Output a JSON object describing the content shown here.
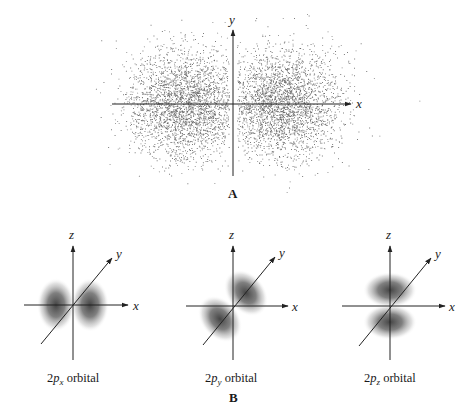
{
  "figure": {
    "panel_a": {
      "label": "A",
      "axes": {
        "x_label": "x",
        "y_label": "y",
        "origin": [
          233,
          104
        ],
        "x_range": [
          112,
          351
        ],
        "y_range": [
          30,
          176
        ]
      },
      "dot_cloud": {
        "description": "electron probability density dot plot of 2p orbital",
        "dot_color": "#555555",
        "seed": 7,
        "lobes": [
          {
            "cx": 186,
            "cy": 104,
            "sx": 30,
            "sy": 26,
            "count": 2600
          },
          {
            "cx": 281,
            "cy": 104,
            "sx": 30,
            "sy": 26,
            "count": 2600
          }
        ],
        "gap_half_width": 4,
        "sparse_halo": {
          "count": 700,
          "rx": 58,
          "ry": 66
        }
      }
    },
    "panel_b": {
      "label": "B",
      "orbitals": [
        {
          "name": "2px",
          "prefix": "2",
          "p": "p",
          "subscript": "x",
          "suffix": " orbital",
          "origin": [
            73,
            305
          ],
          "axes": {
            "z_top": 246,
            "z_bottom": 360,
            "x_left": 24,
            "x_right": 128,
            "y_from": [
              41,
              344
            ],
            "y_to": [
              112,
              258
            ]
          },
          "lobe_orientation": "x"
        },
        {
          "name": "2py",
          "prefix": "2",
          "p": "p",
          "subscript": "y",
          "suffix": " orbital",
          "origin": [
            233,
            306
          ],
          "axes": {
            "z_top": 246,
            "z_bottom": 360,
            "x_left": 186,
            "x_right": 288,
            "y_from": [
              203,
              345
            ],
            "y_to": [
              275,
              257
            ]
          },
          "lobe_orientation": "y"
        },
        {
          "name": "2pz",
          "prefix": "2",
          "p": "p",
          "subscript": "z",
          "suffix": " orbital",
          "origin": [
            390,
            306
          ],
          "axes": {
            "z_top": 246,
            "z_bottom": 360,
            "x_left": 342,
            "x_right": 445,
            "y_from": [
              359,
              346
            ],
            "y_to": [
              431,
              258
            ]
          },
          "lobe_orientation": "z"
        }
      ],
      "axis_labels": {
        "x": "x",
        "y": "y",
        "z": "z"
      }
    },
    "colors": {
      "axis": "#222222",
      "lobe_core": "#3a3a3a",
      "background": "#ffffff"
    }
  }
}
